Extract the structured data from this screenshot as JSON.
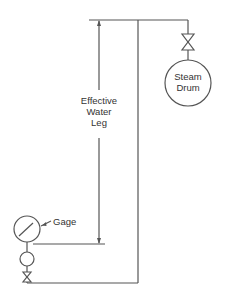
{
  "diagram": {
    "labels": {
      "steam_drum_line1": "Steam",
      "steam_drum_line2": "Drum",
      "water_leg_line1": "Effective",
      "water_leg_line2": "Water",
      "water_leg_line3": "Leg",
      "gage": "Gage"
    },
    "colors": {
      "stroke": "#555555",
      "text": "#333333",
      "background": "#ffffff"
    },
    "components": [
      "steam-drum",
      "isolation-valve-top",
      "impulse-line",
      "effective-water-leg-dimension",
      "pressure-gage",
      "siphon-coil",
      "isolation-valve-bottom"
    ]
  }
}
